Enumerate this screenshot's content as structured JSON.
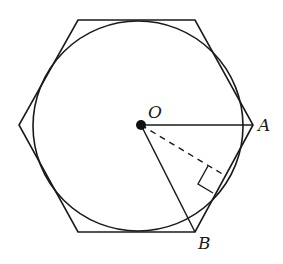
{
  "diagram": {
    "type": "geometry",
    "labels": {
      "center": "O",
      "vertex_a": "A",
      "vertex_b": "B"
    },
    "colors": {
      "stroke": "#1a1a1a",
      "background": "#ffffff"
    },
    "elements": [
      "regular hexagon",
      "inscribed circle",
      "center point O",
      "segment OA",
      "segment OB",
      "dashed apothem from O to side AB",
      "right-angle marker"
    ]
  }
}
